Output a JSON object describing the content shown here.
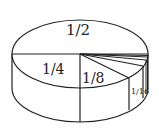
{
  "diagram": {
    "title": "",
    "type": "3d-pie-cylinder",
    "labels": {
      "half": "1/2",
      "quarter": "1/4",
      "eighth": "1/8",
      "sixteenth": "1/16"
    },
    "slices": [
      {
        "label": "1/2",
        "fraction": 0.5
      },
      {
        "label": "1/4",
        "fraction": 0.25
      },
      {
        "label": "1/8",
        "fraction": 0.125
      },
      {
        "label": "1/16",
        "fraction": 0.0625
      }
    ],
    "colors": {
      "stroke": "#222222",
      "fill": "#ffffff"
    }
  }
}
